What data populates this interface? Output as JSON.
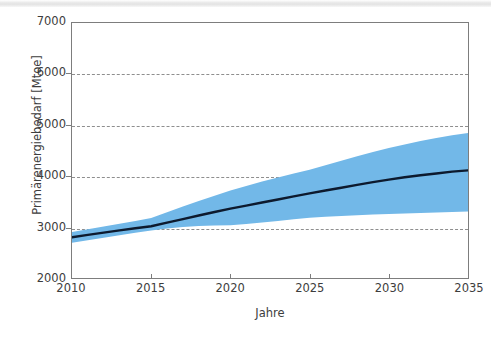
{
  "chart_data": {
    "type": "area",
    "title": "",
    "subtitle": "",
    "xlabel": "Jahre",
    "ylabel": "Primärenergiebedarf [Mtoe]",
    "xlim": [
      2010,
      2035
    ],
    "ylim": [
      2000,
      7000
    ],
    "xticks": [
      2010,
      2015,
      2020,
      2025,
      2030,
      2035
    ],
    "xtick_labels": [
      "2010",
      "2015",
      "2020",
      "2025",
      "2030",
      "2035"
    ],
    "yticks": [
      2000,
      3000,
      4000,
      5000,
      6000,
      7000
    ],
    "ytick_labels": [
      "2000",
      "3000",
      "4000",
      "5000",
      "6000",
      "7000"
    ],
    "grid": "horizontal-dashed",
    "legend": "none",
    "colors": {
      "band": "#72b8e8",
      "line": "#0d1a2e",
      "grid": "#8e8e8e",
      "axis": "#7d7d7d",
      "text": "#3d3d3d",
      "background": "#ffffff"
    },
    "x": [
      2010,
      2011,
      2012,
      2013,
      2014,
      2015,
      2016,
      2017,
      2018,
      2019,
      2020,
      2021,
      2022,
      2023,
      2024,
      2025,
      2026,
      2027,
      2028,
      2029,
      2030,
      2031,
      2032,
      2033,
      2034,
      2035
    ],
    "series": [
      {
        "name": "Primärenergiebedarf (Mittelwert)",
        "role": "line",
        "values": [
          2800,
          2845,
          2890,
          2935,
          2975,
          3015,
          3085,
          3155,
          3225,
          3295,
          3360,
          3420,
          3480,
          3540,
          3600,
          3660,
          3715,
          3770,
          3825,
          3880,
          3930,
          3975,
          4015,
          4050,
          4085,
          4110
        ]
      },
      {
        "name": "Bandbreite oben",
        "role": "band-upper",
        "values": [
          2900,
          2955,
          3010,
          3065,
          3120,
          3175,
          3290,
          3400,
          3510,
          3615,
          3715,
          3805,
          3890,
          3970,
          4050,
          4125,
          4210,
          4300,
          4385,
          4470,
          4550,
          4620,
          4685,
          4745,
          4800,
          4845
        ]
      },
      {
        "name": "Bandbreite unten",
        "role": "band-lower",
        "values": [
          2690,
          2740,
          2790,
          2840,
          2885,
          2930,
          2970,
          3000,
          3020,
          3030,
          3035,
          3060,
          3090,
          3120,
          3150,
          3180,
          3200,
          3215,
          3230,
          3245,
          3255,
          3265,
          3275,
          3285,
          3295,
          3305
        ]
      }
    ]
  },
  "figure": {
    "y_axis_title": "Primärenergiebedarf [Mtoe]",
    "x_axis_title": "Jahre"
  }
}
